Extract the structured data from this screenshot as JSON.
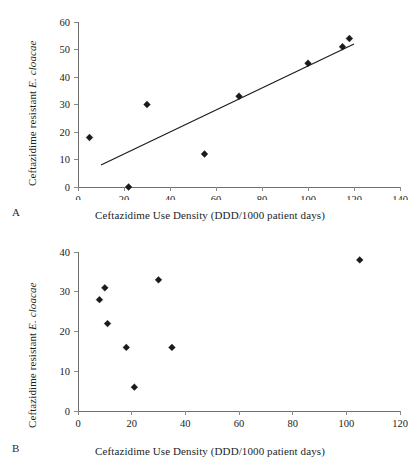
{
  "figure": {
    "panels": [
      {
        "letter": "A",
        "xlabel": "Ceftazidime Use Density (DDD/1000 patient days)",
        "ylabel_plain": "Ceftazidime resistant ",
        "ylabel_species": "E. cloacae"
      },
      {
        "letter": "B",
        "xlabel": "Ceftazidime Use Density (DDD/1000 patient days)",
        "ylabel_plain": "Ceftazidime resistant ",
        "ylabel_species": "E. cloacae"
      }
    ]
  },
  "chart_data": [
    {
      "type": "scatter",
      "panel": "A",
      "title": "",
      "xlabel": "Ceftazidime Use Density (DDD/1000 patient days)",
      "ylabel": "Ceftazidime resistant E. cloacae",
      "xlim": [
        0,
        140
      ],
      "ylim": [
        0,
        60
      ],
      "xticks": [
        0,
        20,
        40,
        60,
        80,
        100,
        120,
        140
      ],
      "yticks": [
        0,
        10,
        20,
        30,
        40,
        50,
        60
      ],
      "grid": false,
      "legend": "none",
      "marker": "filled-diamond",
      "marker_color": "#1a1a1a",
      "points": [
        {
          "x": 5,
          "y": 18
        },
        {
          "x": 22,
          "y": 0
        },
        {
          "x": 30,
          "y": 30
        },
        {
          "x": 55,
          "y": 12
        },
        {
          "x": 70,
          "y": 33
        },
        {
          "x": 100,
          "y": 45
        },
        {
          "x": 115,
          "y": 51
        },
        {
          "x": 118,
          "y": 54
        }
      ],
      "trendline": {
        "present": true,
        "color": "#1c1c1c",
        "x_start": 10,
        "y_start": 8,
        "x_end": 120,
        "y_end": 52
      }
    },
    {
      "type": "scatter",
      "panel": "B",
      "title": "",
      "xlabel": "Ceftazidime Use Density (DDD/1000 patient days)",
      "ylabel": "Ceftazidime resistant E. cloacae",
      "xlim": [
        0,
        120
      ],
      "ylim": [
        0,
        40
      ],
      "xticks": [
        0,
        20,
        40,
        60,
        80,
        100,
        120
      ],
      "yticks": [
        0,
        10,
        20,
        30,
        40
      ],
      "grid": false,
      "legend": "none",
      "marker": "filled-diamond",
      "marker_color": "#1a1a1a",
      "points": [
        {
          "x": 8,
          "y": 28
        },
        {
          "x": 10,
          "y": 31
        },
        {
          "x": 11,
          "y": 22
        },
        {
          "x": 18,
          "y": 16
        },
        {
          "x": 21,
          "y": 6
        },
        {
          "x": 30,
          "y": 33
        },
        {
          "x": 35,
          "y": 16
        },
        {
          "x": 105,
          "y": 38
        }
      ],
      "trendline": {
        "present": false
      }
    }
  ]
}
